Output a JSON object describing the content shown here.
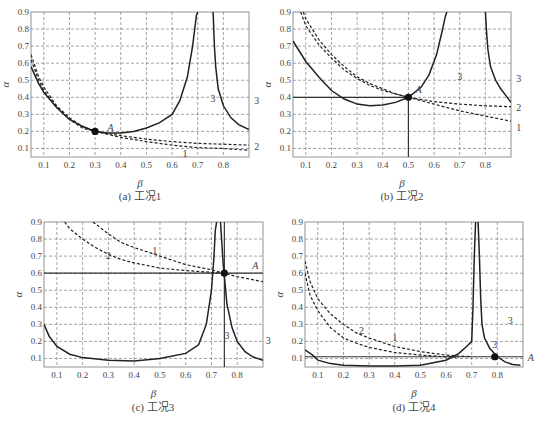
{
  "figure": {
    "panels_count": 4
  },
  "chart_data": [
    {
      "id": "a",
      "type": "line",
      "caption": "(a) 工况1",
      "xlabel": "β",
      "ylabel": "α",
      "xlim": [
        0.05,
        0.9
      ],
      "ylim": [
        0.05,
        0.9
      ],
      "xticks": [
        0.1,
        0.2,
        0.3,
        0.4,
        0.5,
        0.6,
        0.7,
        0.8
      ],
      "yticks": [
        0.1,
        0.2,
        0.3,
        0.4,
        0.5,
        0.6,
        0.7,
        0.8,
        0.9
      ],
      "grid": true,
      "frame": {
        "x": 31,
        "y": 12,
        "w": 218,
        "h": 145
      },
      "series": [
        {
          "name": "3",
          "style": "solid",
          "x": [
            0.05,
            0.08,
            0.1,
            0.15,
            0.2,
            0.25,
            0.3,
            0.35,
            0.4,
            0.45,
            0.5,
            0.55,
            0.6,
            0.63,
            0.66,
            0.68,
            0.695,
            0.7
          ],
          "y": [
            0.58,
            0.48,
            0.43,
            0.34,
            0.27,
            0.23,
            0.2,
            0.19,
            0.19,
            0.2,
            0.22,
            0.25,
            0.3,
            0.38,
            0.52,
            0.7,
            0.88,
            0.9
          ]
        },
        {
          "name": "3",
          "style": "solid",
          "x": [
            0.76,
            0.765,
            0.77,
            0.78,
            0.8,
            0.83,
            0.86,
            0.9
          ],
          "y": [
            0.9,
            0.7,
            0.58,
            0.45,
            0.35,
            0.28,
            0.24,
            0.21
          ]
        },
        {
          "name": "2",
          "style": "dashed",
          "x": [
            0.05,
            0.08,
            0.1,
            0.15,
            0.2,
            0.25,
            0.3,
            0.4,
            0.5,
            0.6,
            0.7,
            0.8,
            0.9
          ],
          "y": [
            0.62,
            0.5,
            0.44,
            0.34,
            0.27,
            0.22,
            0.2,
            0.175,
            0.155,
            0.14,
            0.13,
            0.125,
            0.12
          ]
        },
        {
          "name": "1",
          "style": "dashed",
          "x": [
            0.05,
            0.08,
            0.1,
            0.15,
            0.2,
            0.25,
            0.3,
            0.4,
            0.5,
            0.6,
            0.7,
            0.8,
            0.9
          ],
          "y": [
            0.65,
            0.52,
            0.46,
            0.35,
            0.28,
            0.23,
            0.2,
            0.165,
            0.14,
            0.12,
            0.105,
            0.1,
            0.09
          ]
        }
      ],
      "labels": [
        {
          "text": "A",
          "x": 0.36,
          "y": 0.22,
          "italic": true
        },
        {
          "text": "3",
          "x": 0.76,
          "y": 0.39
        },
        {
          "text": "3",
          "x": 0.93,
          "y": 0.38,
          "outside": true
        },
        {
          "text": "2",
          "x": 0.93,
          "y": 0.11,
          "outside": true
        },
        {
          "text": "1",
          "x": 0.65,
          "y": 0.07
        }
      ],
      "points": [
        {
          "name": "A",
          "x": 0.3,
          "y": 0.2
        }
      ],
      "hlines": [],
      "vlines": []
    },
    {
      "id": "b",
      "type": "line",
      "caption": "(b) 工况2",
      "xlabel": "β",
      "ylabel": "α",
      "xlim": [
        0.05,
        0.9
      ],
      "ylim": [
        0.05,
        0.9
      ],
      "xticks": [
        0.1,
        0.2,
        0.3,
        0.4,
        0.5,
        0.6,
        0.7,
        0.8
      ],
      "yticks": [
        0.1,
        0.2,
        0.3,
        0.4,
        0.5,
        0.6,
        0.7,
        0.8,
        0.9
      ],
      "grid": true,
      "frame": {
        "x": 293,
        "y": 12,
        "w": 218,
        "h": 145
      },
      "series": [
        {
          "name": "3",
          "style": "solid",
          "x": [
            0.05,
            0.1,
            0.15,
            0.2,
            0.25,
            0.3,
            0.35,
            0.4,
            0.45,
            0.5,
            0.55,
            0.58,
            0.61,
            0.63,
            0.645,
            0.65
          ],
          "y": [
            0.73,
            0.61,
            0.52,
            0.44,
            0.39,
            0.36,
            0.35,
            0.355,
            0.37,
            0.4,
            0.46,
            0.53,
            0.65,
            0.78,
            0.88,
            0.9
          ]
        },
        {
          "name": "3",
          "style": "solid",
          "x": [
            0.8,
            0.805,
            0.81,
            0.82,
            0.84,
            0.86,
            0.88,
            0.9
          ],
          "y": [
            0.9,
            0.78,
            0.68,
            0.58,
            0.5,
            0.45,
            0.41,
            0.37
          ]
        },
        {
          "name": "2",
          "style": "dashed",
          "x": [
            0.08,
            0.1,
            0.15,
            0.2,
            0.25,
            0.3,
            0.35,
            0.4,
            0.45,
            0.5,
            0.6,
            0.7,
            0.8,
            0.9
          ],
          "y": [
            0.9,
            0.82,
            0.71,
            0.63,
            0.56,
            0.51,
            0.47,
            0.44,
            0.42,
            0.4,
            0.375,
            0.36,
            0.35,
            0.345
          ]
        },
        {
          "name": "1",
          "style": "dashed",
          "x": [
            0.09,
            0.1,
            0.15,
            0.2,
            0.25,
            0.3,
            0.35,
            0.4,
            0.45,
            0.5,
            0.6,
            0.7,
            0.8,
            0.9
          ],
          "y": [
            0.9,
            0.86,
            0.74,
            0.65,
            0.58,
            0.52,
            0.48,
            0.45,
            0.42,
            0.4,
            0.36,
            0.32,
            0.29,
            0.26
          ]
        }
      ],
      "labels": [
        {
          "text": "A",
          "x": 0.54,
          "y": 0.44,
          "italic": true
        },
        {
          "text": "3",
          "x": 0.7,
          "y": 0.52
        },
        {
          "text": "3",
          "x": 0.93,
          "y": 0.51,
          "outside": true
        },
        {
          "text": "2",
          "x": 0.93,
          "y": 0.34,
          "outside": true
        },
        {
          "text": "1",
          "x": 0.93,
          "y": 0.22,
          "outside": true
        }
      ],
      "points": [
        {
          "name": "A",
          "x": 0.5,
          "y": 0.4
        }
      ],
      "hlines": [
        {
          "y": 0.4,
          "x0": 0.05,
          "x1": 0.5
        }
      ],
      "vlines": [
        {
          "x": 0.5,
          "y0": 0.05,
          "y1": 0.4
        }
      ]
    },
    {
      "id": "c",
      "type": "line",
      "caption": "(c) 工况3",
      "xlabel": "β",
      "ylabel": "α",
      "xlim": [
        0.05,
        0.9
      ],
      "ylim": [
        0.05,
        0.9
      ],
      "xticks": [
        0.1,
        0.2,
        0.3,
        0.4,
        0.5,
        0.6,
        0.7,
        0.8
      ],
      "yticks": [
        0.1,
        0.2,
        0.3,
        0.4,
        0.5,
        0.6,
        0.7,
        0.8,
        0.9
      ],
      "grid": true,
      "frame": {
        "x": 44,
        "y": 222,
        "w": 219,
        "h": 145
      },
      "series": [
        {
          "name": "3",
          "style": "solid",
          "x": [
            0.05,
            0.07,
            0.1,
            0.15,
            0.2,
            0.3,
            0.4,
            0.5,
            0.6,
            0.65,
            0.68,
            0.7,
            0.71,
            0.715,
            0.72
          ],
          "y": [
            0.3,
            0.23,
            0.17,
            0.125,
            0.105,
            0.09,
            0.085,
            0.1,
            0.13,
            0.18,
            0.3,
            0.5,
            0.7,
            0.85,
            0.9
          ]
        },
        {
          "name": "3",
          "style": "solid",
          "x": [
            0.735,
            0.74,
            0.745,
            0.75,
            0.76,
            0.78,
            0.8,
            0.83,
            0.86,
            0.9
          ],
          "y": [
            0.9,
            0.78,
            0.66,
            0.58,
            0.42,
            0.28,
            0.2,
            0.14,
            0.11,
            0.09
          ]
        },
        {
          "name": "2",
          "style": "dashed",
          "x": [
            0.13,
            0.15,
            0.2,
            0.25,
            0.3,
            0.35,
            0.4,
            0.5,
            0.6,
            0.7,
            0.75
          ],
          "y": [
            0.9,
            0.86,
            0.8,
            0.75,
            0.71,
            0.68,
            0.66,
            0.63,
            0.615,
            0.605,
            0.6
          ]
        },
        {
          "name": "1",
          "style": "dashed",
          "x": [
            0.24,
            0.3,
            0.35,
            0.4,
            0.5,
            0.6,
            0.7,
            0.75,
            0.8,
            0.9
          ],
          "y": [
            0.9,
            0.83,
            0.78,
            0.75,
            0.7,
            0.65,
            0.62,
            0.6,
            0.58,
            0.55
          ]
        }
      ],
      "labels": [
        {
          "text": "A",
          "x": 0.87,
          "y": 0.64,
          "italic": true
        },
        {
          "text": "2",
          "x": 0.3,
          "y": 0.7
        },
        {
          "text": "1",
          "x": 0.48,
          "y": 0.73
        },
        {
          "text": "3",
          "x": 0.76,
          "y": 0.23
        },
        {
          "text": "3",
          "x": 0.92,
          "y": 0.2,
          "outside": true
        }
      ],
      "points": [
        {
          "name": "A",
          "x": 0.75,
          "y": 0.6
        }
      ],
      "hlines": [
        {
          "y": 0.6,
          "x0": 0.05,
          "x1": 0.9
        }
      ],
      "vlines": [
        {
          "x": 0.75,
          "y0": 0.05,
          "y1": 0.9
        }
      ]
    },
    {
      "id": "d",
      "type": "line",
      "caption": "(d) 工况4",
      "xlabel": "β",
      "ylabel": "α",
      "xlim": [
        0.05,
        0.9
      ],
      "ylim": [
        0.05,
        0.9
      ],
      "xticks": [
        0.1,
        0.2,
        0.3,
        0.4,
        0.5,
        0.6,
        0.7,
        0.8
      ],
      "yticks": [
        0.1,
        0.2,
        0.3,
        0.4,
        0.5,
        0.6,
        0.7,
        0.8,
        0.9
      ],
      "grid": true,
      "frame": {
        "x": 305,
        "y": 222,
        "w": 218,
        "h": 145
      },
      "series": [
        {
          "name": "3",
          "style": "solid",
          "x": [
            0.05,
            0.08,
            0.1,
            0.15,
            0.2,
            0.3,
            0.4,
            0.5,
            0.6,
            0.65,
            0.68,
            0.7,
            0.705,
            0.71,
            0.715
          ],
          "y": [
            0.15,
            0.12,
            0.09,
            0.07,
            0.06,
            0.055,
            0.055,
            0.06,
            0.09,
            0.13,
            0.17,
            0.2,
            0.4,
            0.7,
            0.9
          ]
        },
        {
          "name": "3",
          "style": "solid",
          "x": [
            0.725,
            0.73,
            0.735,
            0.74,
            0.75,
            0.77,
            0.8,
            0.83,
            0.86,
            0.89
          ],
          "y": [
            0.9,
            0.7,
            0.45,
            0.3,
            0.22,
            0.16,
            0.11,
            0.08,
            0.065,
            0.06
          ]
        },
        {
          "name": "2",
          "style": "dashed",
          "x": [
            0.05,
            0.07,
            0.1,
            0.15,
            0.2,
            0.25,
            0.3,
            0.4,
            0.5,
            0.6,
            0.65
          ],
          "y": [
            0.6,
            0.47,
            0.38,
            0.28,
            0.22,
            0.19,
            0.165,
            0.135,
            0.12,
            0.11,
            0.105
          ]
        },
        {
          "name": "1",
          "style": "dashed",
          "x": [
            0.05,
            0.07,
            0.1,
            0.15,
            0.2,
            0.25,
            0.3,
            0.4,
            0.5,
            0.6,
            0.7
          ],
          "y": [
            0.67,
            0.55,
            0.45,
            0.36,
            0.3,
            0.25,
            0.22,
            0.17,
            0.14,
            0.12,
            0.11
          ]
        }
      ],
      "labels": [
        {
          "text": "A",
          "x": 0.93,
          "y": 0.1,
          "italic": true,
          "outside": true
        },
        {
          "text": "2",
          "x": 0.27,
          "y": 0.26
        },
        {
          "text": "1",
          "x": 0.4,
          "y": 0.22
        },
        {
          "text": "3",
          "x": 0.85,
          "y": 0.32
        },
        {
          "text": "3",
          "x": 0.79,
          "y": 0.18
        }
      ],
      "points": [
        {
          "name": "A",
          "x": 0.79,
          "y": 0.11
        }
      ],
      "hlines": [
        {
          "y": 0.11,
          "x0": 0.05,
          "x1": 0.9
        }
      ],
      "vlines": []
    }
  ]
}
